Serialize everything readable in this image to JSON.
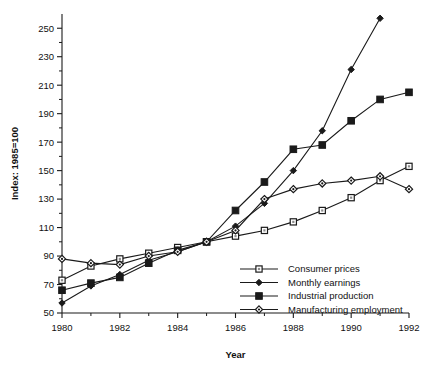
{
  "chart_data": {
    "type": "line",
    "title": "",
    "xlabel": "Year",
    "ylabel": "Index: 1985=100",
    "xlim": [
      1980,
      1992
    ],
    "ylim": [
      50,
      260
    ],
    "xticks": [
      1980,
      1982,
      1984,
      1986,
      1988,
      1990,
      1992
    ],
    "xtick_labels": [
      "1980",
      "1982",
      "1984",
      "1986",
      "1988",
      "1990",
      "1992"
    ],
    "yticks": [
      50,
      70,
      90,
      110,
      130,
      150,
      170,
      190,
      210,
      230,
      250
    ],
    "ytick_labels": [
      "50",
      "70",
      "90",
      "110",
      "130",
      "150",
      "170",
      "190",
      "210",
      "230",
      "250"
    ],
    "minor_xticks": [
      1981,
      1983,
      1985,
      1987,
      1989,
      1991
    ],
    "minor_yticks": [
      60,
      80,
      100,
      120,
      140,
      160,
      180,
      200,
      220,
      240
    ],
    "grid": false,
    "legend_position": "lower right",
    "x": [
      1980,
      1981,
      1982,
      1983,
      1984,
      1985,
      1986,
      1987,
      1988,
      1989,
      1990,
      1991,
      1992
    ],
    "series": [
      {
        "name": "Consumer prices",
        "marker": "open-square",
        "color": "#1a1a1a",
        "values": [
          73,
          83,
          88,
          92,
          96,
          100,
          104,
          108,
          114,
          122,
          131,
          143,
          153
        ]
      },
      {
        "name": "Monthly earnings",
        "marker": "small-filled-diamond",
        "color": "#1a1a1a",
        "values": [
          57,
          69,
          77,
          87,
          93,
          100,
          111,
          127,
          150,
          178,
          221,
          257,
          null
        ]
      },
      {
        "name": "Industrial production",
        "marker": "filled-square",
        "color": "#1a1a1a",
        "values": [
          66,
          71,
          75,
          85,
          94,
          100,
          122,
          142,
          165,
          168,
          185,
          200,
          205
        ]
      },
      {
        "name": "Manufacturing employment",
        "marker": "open-diamond",
        "color": "#1a1a1a",
        "values": [
          88,
          85,
          84,
          90,
          93,
          100,
          108,
          130,
          137,
          141,
          143,
          146,
          137
        ]
      }
    ]
  },
  "legend": {
    "entries": [
      {
        "label": "Consumer prices"
      },
      {
        "label": "Monthly earnings"
      },
      {
        "label": "Industrial production"
      },
      {
        "label": "Manufacturing employment"
      }
    ]
  }
}
